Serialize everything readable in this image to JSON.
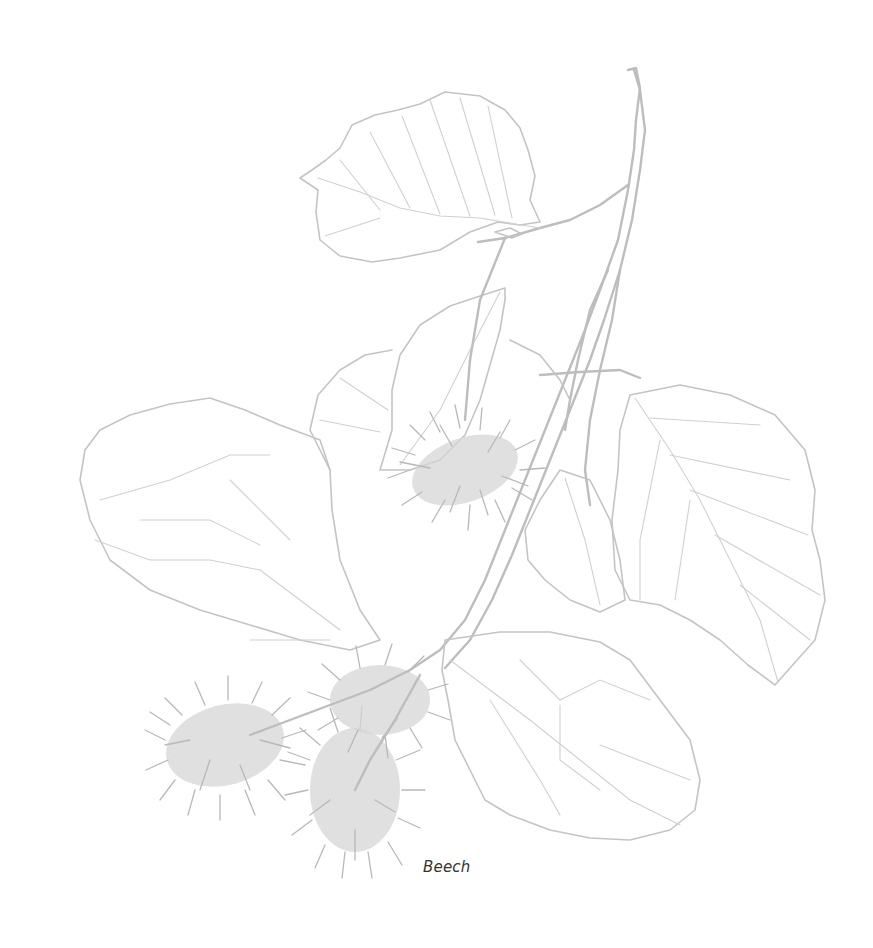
{
  "figure": {
    "caption": "Beech",
    "line_color": "#c4c4c4",
    "caption_color": "#333333",
    "background": "#ffffff"
  }
}
